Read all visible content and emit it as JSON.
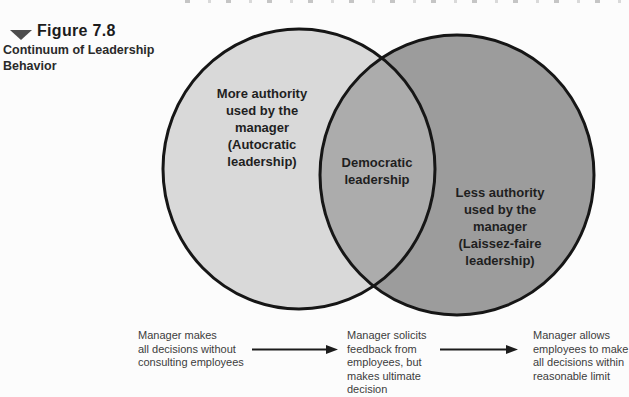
{
  "caption": {
    "figure_label": "Figure 7.8",
    "title": "Continuum of Leadership\nBehavior"
  },
  "venn": {
    "left_circle": {
      "label": "More authority\nused by the\nmanager\n(Autocratic\nleadership)"
    },
    "overlap": {
      "label": "Democratic\nleadership"
    },
    "right_circle": {
      "label": "Less authority\nused by the\nmanager\n(Laissez-faire\nleadership)"
    }
  },
  "continuum": {
    "stages": [
      {
        "text": "Manager makes\nall decisions without\nconsulting employees"
      },
      {
        "text": "Manager solicits\nfeedback from\nemployees, but\nmakes ultimate\ndecision"
      },
      {
        "text": "Manager allows\nemployees to make\nall decisions within\nreasonable limit"
      }
    ]
  },
  "colors": {
    "left_circle_fill": "#d9d9d9",
    "overlap_fill": "#acacac",
    "right_circle_fill": "#9c9c9c",
    "circle_stroke": "#161616",
    "arrow": "#1c1c1c"
  }
}
